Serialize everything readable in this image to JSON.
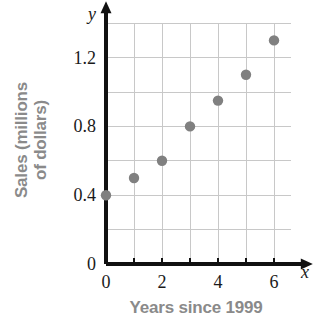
{
  "chart_data": {
    "type": "scatter",
    "title": "",
    "xlabel": "Years since 1999",
    "ylabel_lines": [
      "Sales (millions",
      "of dollars)"
    ],
    "ylabel": "Sales (millions of dollars)",
    "x_axis_variable": "x",
    "y_axis_variable": "y",
    "x": [
      0,
      1,
      2,
      3,
      4,
      5,
      6
    ],
    "values": [
      0.4,
      0.5,
      0.6,
      0.8,
      0.95,
      1.1,
      1.3
    ],
    "points": [
      {
        "x": 0,
        "y": 0.4
      },
      {
        "x": 1,
        "y": 0.5
      },
      {
        "x": 2,
        "y": 0.6
      },
      {
        "x": 3,
        "y": 0.8
      },
      {
        "x": 4,
        "y": 0.95
      },
      {
        "x": 5,
        "y": 1.1
      },
      {
        "x": 6,
        "y": 1.3
      }
    ],
    "xlim": [
      0,
      6.6
    ],
    "ylim": [
      0,
      1.4
    ],
    "x_tick_labels": [
      "0",
      "2",
      "4",
      "6"
    ],
    "x_tick_values": [
      0,
      2,
      4,
      6
    ],
    "x_minor_ticks": [
      1,
      3,
      5
    ],
    "y_tick_labels": [
      "0",
      "0.4",
      "0.8",
      "1.2"
    ],
    "y_tick_values": [
      0,
      0.4,
      0.8,
      1.2
    ],
    "grid": true,
    "grid_x_step": 1,
    "grid_y_step": 0.2,
    "legend": null,
    "legend_position": "none",
    "marker_color": "#808080",
    "grid_color": "#c8c8c8",
    "axis_color": "#111111",
    "label_color": "#8a8a8a",
    "tick_color": "#1a1a1a"
  }
}
